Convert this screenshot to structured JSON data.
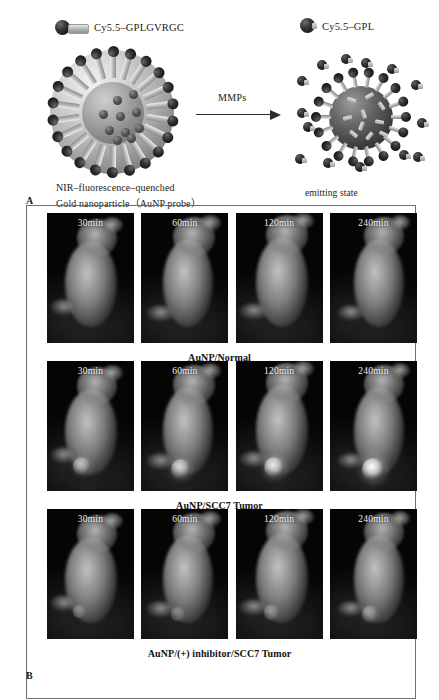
{
  "header": {
    "cut_text": "·······························"
  },
  "panel_a": {
    "label": "A",
    "legend_left": {
      "icon": "cy55-peptide-conjugate-icon",
      "text": "Cy5.5–GPLGVRGC"
    },
    "legend_right": {
      "icon": "cy55-gpl-fragment-icon",
      "text": "Cy5.5–GPL"
    },
    "arrow_label": "MMPs",
    "caption_line1": "NIR–fluorescence–quenched",
    "caption_line2": "Gold nanoparticle（AuNP probe）",
    "caption_right": "emitting state"
  },
  "panel_b": {
    "label": "B",
    "timepoints": [
      "30min",
      "60min",
      "120min",
      "240min"
    ],
    "rows": [
      {
        "caption": "AuNP/Normal",
        "tumor_signal": [
          0,
          0,
          0,
          0
        ]
      },
      {
        "caption": "AuNP/SCC7 Tumor",
        "tumor_signal": [
          62,
          78,
          88,
          100
        ]
      },
      {
        "caption": "AuNP/(+) inhibitor/SCC7 Tumor",
        "tumor_signal": [
          22,
          30,
          38,
          46
        ]
      }
    ]
  },
  "colors": {
    "background": "#ffffff",
    "text": "#1a1a1a",
    "frame_border": "#6f6f6f",
    "image_background": "#050505",
    "timepoint_label": "#f3f3f3"
  }
}
